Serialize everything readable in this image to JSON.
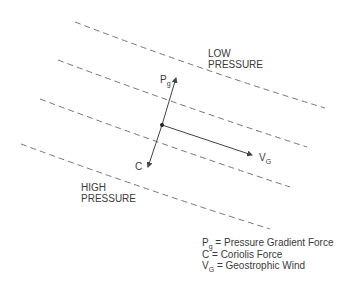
{
  "diagram": {
    "regions": {
      "low": {
        "line1": "LOW",
        "line2": "PRESSURE"
      },
      "high": {
        "line1": "HIGH",
        "line2": "PRESSURE"
      }
    },
    "vectors": {
      "pg": {
        "main": "P",
        "sub": "g"
      },
      "c": {
        "main": "C"
      },
      "vg": {
        "main": "V",
        "sub": "G"
      }
    },
    "legend": [
      {
        "symbol": "P",
        "sub": "g",
        "text": " = Pressure Gradient Force"
      },
      {
        "symbol": "C",
        "sub": "",
        "text": " = Coriolis Force"
      },
      {
        "symbol": "V",
        "sub": "G",
        "text": " = Geostrophic Wind"
      }
    ],
    "colors": {
      "line": "#555555",
      "text": "#3a3a3a"
    }
  }
}
